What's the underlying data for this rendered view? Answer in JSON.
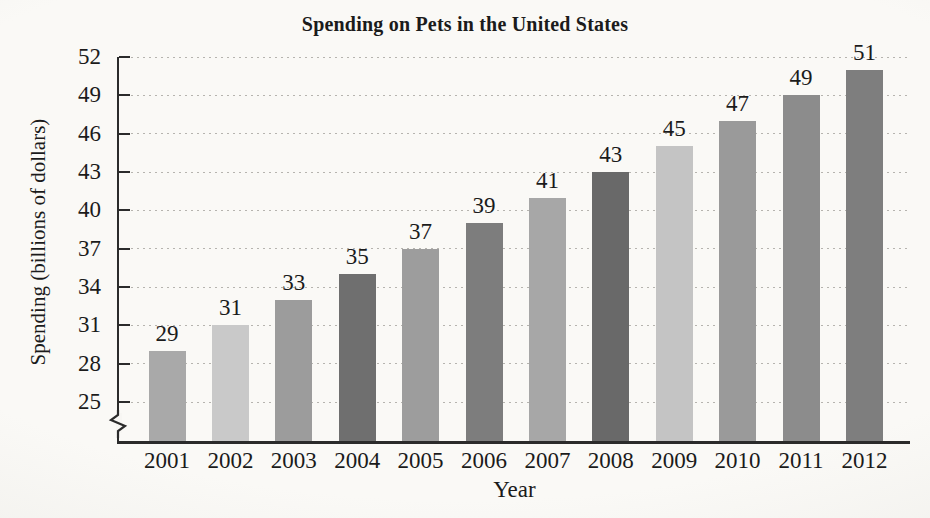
{
  "chart_data": {
    "type": "bar",
    "title": "Spending on Pets in the United States",
    "xlabel": "Year",
    "ylabel": "Spending (billions of dollars)",
    "categories": [
      "2001",
      "2002",
      "2003",
      "2004",
      "2005",
      "2006",
      "2007",
      "2008",
      "2009",
      "2010",
      "2011",
      "2012"
    ],
    "values": [
      29,
      31,
      33,
      35,
      37,
      39,
      41,
      43,
      45,
      47,
      49,
      51
    ],
    "value_labels_shown": true,
    "bar_colors": [
      "#a9a9a9",
      "#c9c9c9",
      "#9c9c9c",
      "#6f6f6f",
      "#9d9d9d",
      "#7d7d7d",
      "#a7a7a7",
      "#696969",
      "#c4c4c4",
      "#9a9a9a",
      "#8c8c8c",
      "#7e7e7e"
    ],
    "y_ticks": [
      25,
      28,
      31,
      34,
      37,
      40,
      43,
      46,
      49,
      52
    ],
    "ylim": [
      25,
      52
    ],
    "axis_break_below": 25,
    "grid": "horizontal-dotted",
    "legend": "none",
    "colors": {
      "axis": "#2b2b2b",
      "gridline": "#b6b4af",
      "text": "#1b1b1b",
      "background": "#faf9f6"
    }
  }
}
